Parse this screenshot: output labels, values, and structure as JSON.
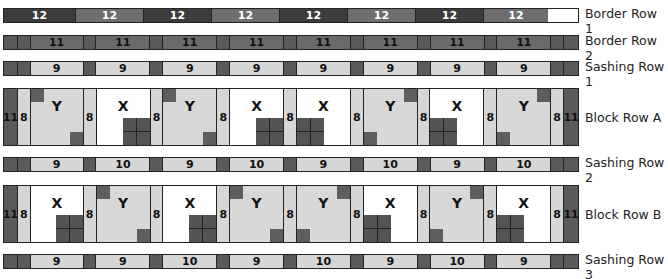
{
  "rows": {
    "border_row_1": {
      "label": "Border Row 1",
      "segments": [
        "12",
        "12",
        "12",
        "12",
        "12",
        "12",
        "12",
        "12"
      ]
    },
    "border_row_2": {
      "label": "Border Row 2",
      "segments": [
        "11",
        "11",
        "11",
        "11",
        "11",
        "11",
        "11",
        "11"
      ]
    },
    "sashing_row_1": {
      "label": "Sashing Row 1",
      "segments": [
        "9",
        "9",
        "9",
        "9",
        "9",
        "9",
        "9",
        "9"
      ]
    },
    "block_row_a": {
      "label": "Block Row A",
      "side_border": "11",
      "sashing": "8",
      "blocks": [
        "Y",
        "X",
        "Y",
        "X",
        "X",
        "Y",
        "X",
        "Y"
      ]
    },
    "sashing_row_2": {
      "label": "Sashing Row 2",
      "segments": [
        "9",
        "10",
        "9",
        "10",
        "9",
        "10",
        "9",
        "10"
      ]
    },
    "block_row_b": {
      "label": "Block Row B",
      "side_border": "11",
      "sashing": "8",
      "blocks": [
        "X",
        "Y",
        "X",
        "Y",
        "Y",
        "X",
        "Y",
        "X"
      ]
    },
    "sashing_row_3": {
      "label": "Sashing Row 3",
      "segments": [
        "9",
        "9",
        "10",
        "9",
        "10",
        "9",
        "10",
        "9"
      ]
    }
  },
  "colors": {
    "dark": "#3c3c3c",
    "medium": "#6a6a6a",
    "light": "#d6d6d6",
    "white": "#ffffff",
    "outline": "#222222"
  }
}
